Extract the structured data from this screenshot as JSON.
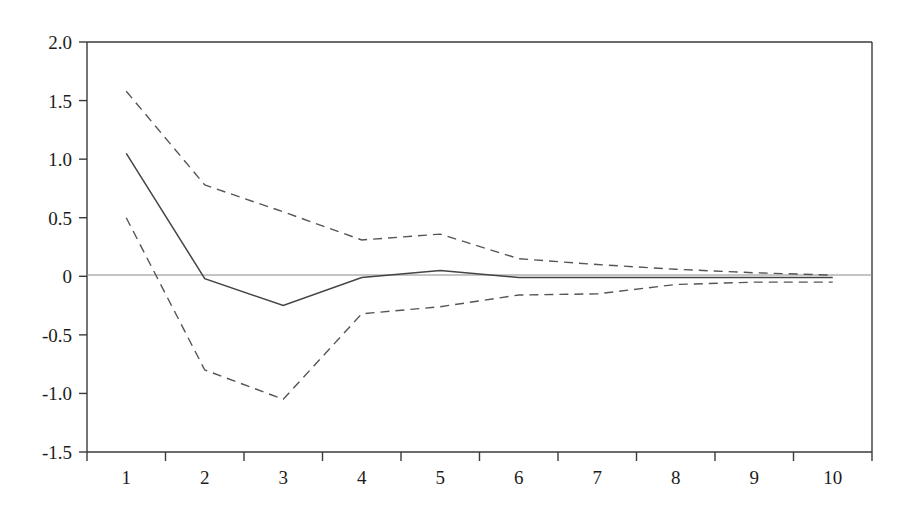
{
  "chart_data": {
    "type": "line",
    "title": "",
    "subtitle": "",
    "xlabel": "",
    "ylabel": "",
    "x": [
      1,
      2,
      3,
      4,
      5,
      6,
      7,
      8,
      9,
      10
    ],
    "xtick_labels": [
      "1",
      "2",
      "3",
      "4",
      "5",
      "6",
      "7",
      "8",
      "9",
      "10"
    ],
    "ytick_labels": [
      "2.0",
      "1.5",
      "1.0",
      "0.5",
      "0",
      "-0.5",
      "-1.0",
      "-1.5"
    ],
    "ytick_values": [
      2.0,
      1.5,
      1.0,
      0.5,
      0,
      -0.5,
      -1.0,
      -1.5
    ],
    "ylim": [
      -1.5,
      2.0
    ],
    "xlim": [
      0.5,
      10.5
    ],
    "grid": false,
    "legend": null,
    "legend_position": "none",
    "zero_line": 0,
    "series": [
      {
        "name": "upper-confidence-band",
        "style": "dashed",
        "color": "#555555",
        "values": [
          1.58,
          0.78,
          0.55,
          0.31,
          0.36,
          0.15,
          0.1,
          0.06,
          0.03,
          0.01
        ]
      },
      {
        "name": "impulse-response",
        "style": "solid",
        "color": "#444444",
        "values": [
          1.05,
          -0.02,
          -0.25,
          -0.01,
          0.05,
          -0.01,
          -0.01,
          -0.01,
          -0.01,
          -0.01
        ]
      },
      {
        "name": "lower-confidence-band",
        "style": "dashed",
        "color": "#555555",
        "values": [
          0.5,
          -0.8,
          -1.05,
          -0.32,
          -0.26,
          -0.16,
          -0.15,
          -0.07,
          -0.05,
          -0.05
        ]
      }
    ]
  },
  "axis": {
    "y_labels": [
      "2.0",
      "1.5",
      "1.0",
      "0.5",
      "0",
      "-0.5",
      "-1.0",
      "-1.5"
    ],
    "x_labels": [
      "1",
      "2",
      "3",
      "4",
      "5",
      "6",
      "7",
      "8",
      "9",
      "10"
    ]
  },
  "colors": {
    "axis": "#3a3a3a",
    "solid_series": "#444444",
    "dashed_series": "#555555",
    "zero_line": "#8a8a8a",
    "background": "#ffffff",
    "text": "#1c1c1c"
  }
}
